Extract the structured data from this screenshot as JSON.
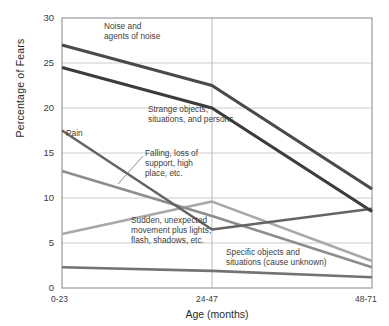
{
  "chart_data": {
    "type": "line",
    "title": "",
    "xlabel": "Age  (months)",
    "ylabel": "Percentage of Fears",
    "categories": [
      "0-23",
      "24-47",
      "48-71"
    ],
    "ylim": [
      0,
      30
    ],
    "yticks": [
      0,
      5,
      10,
      15,
      20,
      25,
      30
    ],
    "grid": true,
    "legend_position": "inline annotations",
    "series": [
      {
        "name": "Noise and agents of noise",
        "values": [
          27.0,
          22.5,
          11.0
        ],
        "color": "#4a4a4a",
        "width": 3.2
      },
      {
        "name": "Strange objects, situations, and persons",
        "values": [
          24.5,
          20.0,
          8.5
        ],
        "color": "#3c3c3c",
        "width": 3.2
      },
      {
        "name": "Pain",
        "values": [
          17.5,
          6.5,
          8.8
        ],
        "color": "#646464",
        "width": 2.6
      },
      {
        "name": "Falling, loss of support, high place, etc.",
        "values": [
          13.0,
          8.0,
          2.3
        ],
        "color": "#8d8d8d",
        "width": 2.6
      },
      {
        "name": "Sudden, unexpected movement plus lights, flash, shadows, etc.",
        "values": [
          6.0,
          9.6,
          3.0
        ],
        "color": "#a8a8a8",
        "width": 2.6
      },
      {
        "name": "Specific objects and situations (cause unknown)",
        "values": [
          2.3,
          1.9,
          1.2
        ],
        "color": "#737373",
        "width": 2.6
      }
    ]
  },
  "yticks": {
    "t30": "30",
    "t25": "25",
    "t20": "20",
    "t15": "15",
    "t10": "10",
    "t5": "5",
    "t0": "0"
  },
  "xticks": {
    "x1": "0-23",
    "x2": "24-47",
    "x3": "48-71"
  },
  "axis": {
    "ylabel": "Percentage of Fears",
    "xlabel": "Age  (months)"
  },
  "annotations": {
    "noise": "Noise and\nagents of noise",
    "strange": "Strange objects,\nsituations, and persons",
    "pain": "Pain",
    "falling": "Falling, loss of\nsupport, high\nplace, etc.",
    "sudden": "Sudden, unexpected\nmovement plus lights,\nflash, shadows, etc.",
    "specific": "Specific objects and\nsituations (cause unknown)"
  },
  "colors": {
    "grid": "#cccccc",
    "frame": "#9a9a9a",
    "text": "#2b2b2b"
  }
}
